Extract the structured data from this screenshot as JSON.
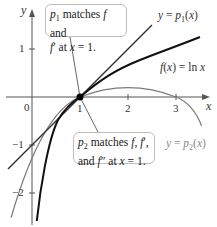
{
  "diagram": {
    "axes": {
      "x_label": "x",
      "y_label": "y",
      "x_ticks": [
        "0",
        "1",
        "2",
        "3"
      ],
      "y_ticks": [
        "1",
        "−1",
        "−2"
      ]
    },
    "curves": {
      "p1_label": "y = p1(x)",
      "f_label": "f(x) = ln x",
      "p2_label": "y = p2(x)"
    },
    "callouts": {
      "top_line1": "p1 matches f and",
      "top_line2": "f′ at x = 1.",
      "bottom_line1": "p2 matches f, f′,",
      "bottom_line2": "and f″ at x = 1."
    },
    "point": {
      "x": 1,
      "y": 0
    },
    "colors": {
      "axis": "#555555",
      "p1": "#333333",
      "f": "#111111",
      "p2": "#7a7a7a",
      "box_border": "#bdbdbd"
    }
  }
}
